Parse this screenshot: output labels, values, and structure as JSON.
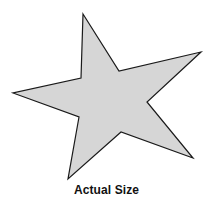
{
  "figure": {
    "shape": "five-point-star",
    "fill_color": "#d6d6d6",
    "stroke_color": "#1a1a1a",
    "points": "83,14 119,71 201,52 147,102 193,158 121,132 68,179 79,117 13,93 81,78",
    "caption": "Actual Size"
  }
}
